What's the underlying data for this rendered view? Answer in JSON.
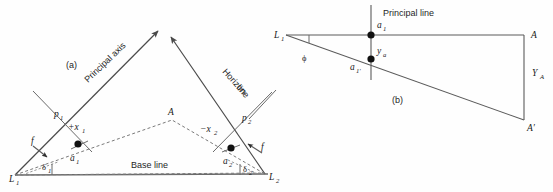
{
  "figure": {
    "panels": [
      {
        "id": "a",
        "tag": "(a)",
        "tag_x": 66,
        "tag_y": 68,
        "description": "Plan view of two camera stations L1 and L2 with base line, principal axes converging, horizon line and image points a1, a2 of ground point A"
      },
      {
        "id": "b",
        "tag": "(b)",
        "tag_x": 392,
        "tag_y": 102,
        "description": "Elevation view showing principal line, image points a1 and a1-prime, tilt angle phi and elevation YA of point A"
      }
    ]
  },
  "panel_a": {
    "labels": [
      {
        "key": "principal_axis",
        "text": "Principal axis",
        "x": 88,
        "y": 83,
        "rotation": -44,
        "style": "sans"
      },
      {
        "key": "horizon_line_1",
        "text": "Horizon",
        "x": 222,
        "y": 72,
        "rotation": 48,
        "style": "sans"
      },
      {
        "key": "horizon_line_2",
        "text": "line",
        "x": 236,
        "y": 88,
        "rotation": 48,
        "style": "sans"
      },
      {
        "key": "base_line",
        "text": "Base line",
        "x": 131,
        "y": 168,
        "rotation": 0,
        "style": "sans"
      }
    ],
    "points": [
      {
        "key": "L1",
        "base": "L",
        "sub": "1",
        "x": 9,
        "y": 182,
        "dot": false
      },
      {
        "key": "L2",
        "base": "L",
        "sub": "2",
        "x": 269,
        "y": 180,
        "dot": false
      },
      {
        "key": "A",
        "base": "A",
        "sub": "",
        "x": 168,
        "y": 115,
        "dot": false
      },
      {
        "key": "a1",
        "base": "a",
        "sub": "1",
        "x": 70,
        "y": 160,
        "dot": true,
        "dot_x": 78,
        "dot_y": 144
      },
      {
        "key": "a2",
        "base": "a",
        "sub": "2",
        "x": 224,
        "y": 163,
        "dot": true,
        "dot_x": 231,
        "dot_y": 148
      },
      {
        "key": "p1",
        "base": "p",
        "sub": "1",
        "x": 56,
        "y": 117,
        "dot": false
      },
      {
        "key": "p2",
        "base": "p",
        "sub": "2",
        "x": 243,
        "y": 121,
        "dot": false
      }
    ],
    "measures": [
      {
        "key": "plus_x1",
        "text": "+x",
        "sub": "1",
        "x": 71,
        "y": 128
      },
      {
        "key": "minus_x2",
        "text": "−x",
        "sub": "2",
        "x": 202,
        "y": 131
      },
      {
        "key": "f_left",
        "text": "f",
        "sub": "",
        "x": 34,
        "y": 146
      },
      {
        "key": "f_right",
        "text": "f",
        "sub": "",
        "x": 259,
        "y": 150
      },
      {
        "key": "delta1",
        "text": "δ",
        "sub": "1",
        "x": 44,
        "y": 169
      },
      {
        "key": "delta2",
        "text": "δ",
        "sub": "2",
        "x": 245,
        "y": 171
      }
    ]
  },
  "panel_b": {
    "labels": [
      {
        "key": "principal_line",
        "text": "Principal line",
        "x": 383,
        "y": 16,
        "style": "sans"
      }
    ],
    "points": [
      {
        "key": "L1b",
        "base": "L",
        "sub": "1",
        "x": 276,
        "y": 38,
        "dot": false
      },
      {
        "key": "a1b",
        "base": "a",
        "sub": "1",
        "x": 377,
        "y": 28,
        "dot": true,
        "dot_x": 371,
        "dot_y": 35
      },
      {
        "key": "a1prime",
        "base": "a",
        "sub": "1′",
        "x": 352,
        "y": 69,
        "dot": true,
        "dot_x": 371,
        "dot_y": 59
      },
      {
        "key": "ya",
        "base": "y",
        "sub": "a",
        "x": 377,
        "y": 54,
        "dot": false
      },
      {
        "key": "A_upper",
        "base": "A",
        "sub": "",
        "x": 531,
        "y": 38,
        "dot": false
      },
      {
        "key": "A_prime",
        "base": "A′",
        "sub": "",
        "x": 528,
        "y": 130,
        "dot": false
      },
      {
        "key": "YA",
        "base": "Y",
        "sub": "A",
        "x": 534,
        "y": 75,
        "dot": false
      }
    ],
    "measures": [
      {
        "key": "phi",
        "text": "ϕ",
        "sub": "",
        "x": 304,
        "y": 60
      }
    ]
  },
  "geometry": {
    "panel_a": {
      "L1": [
        15,
        175
      ],
      "L2": [
        265,
        174
      ],
      "apex_left_tip": [
        158,
        29
      ],
      "apex_right_tip": [
        170,
        36
      ],
      "A": [
        172,
        120
      ],
      "a1_dot": [
        78,
        144
      ],
      "a2_dot": [
        231,
        148
      ],
      "p1_cross": [
        58,
        112
      ],
      "p2_cross": [
        249,
        119
      ]
    },
    "panel_b": {
      "L1": [
        286,
        35
      ],
      "A": [
        524,
        35
      ],
      "A_prime": [
        524,
        120
      ],
      "principal_line_x": 371,
      "principal_line_top": 5,
      "principal_line_bottom": 80,
      "a1": [
        371,
        35
      ],
      "a1_prime": [
        371,
        59
      ]
    }
  },
  "colors": {
    "line": "#5a5a5a",
    "base_line": "#6a6a6a",
    "dashed": "#7a7a7a",
    "dot": "#111111",
    "text": "#1a1a1a",
    "background": "#ffffff"
  }
}
